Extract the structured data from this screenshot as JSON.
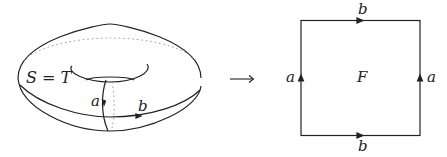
{
  "torus": {
    "surface_label": "S = T",
    "loop_a_label": "a",
    "loop_b_label": "b"
  },
  "arrow": {
    "glyph": "⟶"
  },
  "square": {
    "face_label": "F",
    "top_label": "b",
    "bottom_label": "b",
    "left_label": "a",
    "right_label": "a"
  },
  "colors": {
    "stroke": "#222222",
    "dotted": "#999999"
  }
}
